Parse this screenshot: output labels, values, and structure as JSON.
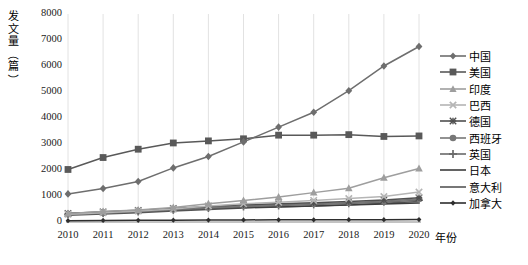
{
  "chart_data": {
    "type": "line",
    "title": "",
    "xlabel": "年份",
    "ylabel": "发文量（篇）",
    "grid": "vertical",
    "legend_position": "right",
    "x": [
      2010,
      2011,
      2012,
      2013,
      2014,
      2015,
      2016,
      2017,
      2018,
      2019,
      2020
    ],
    "xtick_labels": [
      "2010",
      "2011",
      "2012",
      "2013",
      "2014",
      "2015",
      "2016",
      "2017",
      "2018",
      "2019",
      "2020"
    ],
    "ytick_labels": [
      "0",
      "1000",
      "2000",
      "3000",
      "4000",
      "5000",
      "6000",
      "7000",
      "8000"
    ],
    "ylim": [
      0,
      8000
    ],
    "ytick_step": 1000,
    "series": [
      {
        "name": "中国",
        "marker": "diamond",
        "color": "#6e6e6e",
        "values": [
          1080,
          1290,
          1560,
          2080,
          2520,
          3080,
          3650,
          4220,
          5050,
          6000,
          6750
        ]
      },
      {
        "name": "美国",
        "marker": "square",
        "color": "#595959",
        "values": [
          2020,
          2480,
          2800,
          3040,
          3120,
          3200,
          3340,
          3340,
          3360,
          3290,
          3310
        ]
      },
      {
        "name": "印度",
        "marker": "triangle",
        "color": "#9e9e9e",
        "values": [
          330,
          400,
          460,
          560,
          700,
          830,
          960,
          1130,
          1300,
          1700,
          2060
        ]
      },
      {
        "name": "巴西",
        "marker": "x",
        "color": "#b5b5b5",
        "values": [
          300,
          360,
          420,
          500,
          620,
          700,
          760,
          830,
          900,
          980,
          1150
        ]
      },
      {
        "name": "德国",
        "marker": "asterisk",
        "color": "#4f4f4f",
        "values": [
          330,
          390,
          450,
          520,
          600,
          660,
          700,
          740,
          790,
          850,
          930
        ]
      },
      {
        "name": "西班牙",
        "marker": "circle",
        "color": "#777777",
        "values": [
          300,
          350,
          410,
          480,
          560,
          620,
          660,
          700,
          740,
          800,
          880
        ]
      },
      {
        "name": "英国",
        "marker": "plus",
        "color": "#6a6a6a",
        "values": [
          290,
          340,
          400,
          460,
          530,
          590,
          630,
          670,
          710,
          770,
          840
        ]
      },
      {
        "name": "日本",
        "marker": "none",
        "color": "#3d3d3d",
        "values": [
          330,
          370,
          410,
          460,
          520,
          560,
          590,
          620,
          650,
          690,
          730
        ]
      },
      {
        "name": "意大利",
        "marker": "none",
        "color": "#565656",
        "values": [
          260,
          310,
          360,
          420,
          480,
          540,
          580,
          620,
          660,
          720,
          790
        ]
      },
      {
        "name": "加拿大",
        "marker": "diamond-small",
        "color": "#2e2e2e",
        "values": [
          50,
          60,
          65,
          70,
          75,
          80,
          85,
          85,
          90,
          90,
          95
        ]
      }
    ]
  },
  "axis": {
    "y_title_chars": [
      "发",
      "文",
      "量",
      "（",
      "篇",
      "）"
    ]
  }
}
